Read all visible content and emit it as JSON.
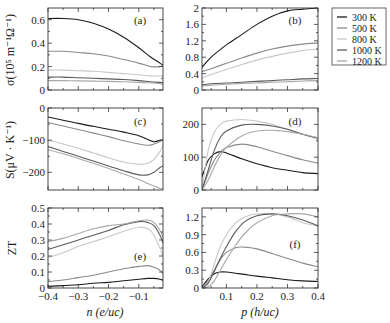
{
  "figure": {
    "legend": {
      "entries": [
        {
          "label": "300 K",
          "color": "#1a1a1a"
        },
        {
          "label": "500 K",
          "color": "#8a8a8a"
        },
        {
          "label": "800 K",
          "color": "#c8c8c8"
        },
        {
          "label": "1000 K",
          "color": "#5a5a5a"
        },
        {
          "label": "1200 K",
          "color": "#a8a8a8"
        }
      ]
    },
    "ylabels": {
      "row1": "σ(10⁵ m⁻¹Ω⁻¹)",
      "row2": "S(μV · K⁻¹)",
      "row3": "ZT"
    },
    "xlabels": {
      "left": "n (e/uc)",
      "right": "p (h/uc)"
    }
  },
  "chart_data": [
    {
      "panel": "(a)",
      "type": "line",
      "xlabel": "n (e/uc)",
      "ylabel": "σ(10^5 m^-1 Ω^-1)",
      "xlim": [
        -0.4,
        -0.02
      ],
      "ylim": [
        0,
        0.7
      ],
      "yticks": [
        0,
        0.2,
        0.4,
        0.6
      ],
      "ytick_labels": [
        "0",
        "0.2",
        "0.4",
        "0.6"
      ],
      "xticks": [
        -0.4,
        -0.3,
        -0.2,
        -0.1
      ],
      "x": [
        -0.4,
        -0.35,
        -0.3,
        -0.25,
        -0.2,
        -0.15,
        -0.1,
        -0.06,
        -0.03,
        -0.02
      ],
      "series": [
        {
          "name": "300 K",
          "values": [
            0.61,
            0.61,
            0.6,
            0.57,
            0.52,
            0.45,
            0.36,
            0.28,
            0.23,
            0.21
          ]
        },
        {
          "name": "500 K",
          "values": [
            0.33,
            0.33,
            0.32,
            0.31,
            0.29,
            0.26,
            0.23,
            0.2,
            0.2,
            0.21
          ]
        },
        {
          "name": "800 K",
          "values": [
            0.17,
            0.17,
            0.165,
            0.16,
            0.15,
            0.14,
            0.13,
            0.12,
            0.12,
            0.12
          ]
        },
        {
          "name": "1000 K",
          "values": [
            0.11,
            0.11,
            0.105,
            0.1,
            0.095,
            0.09,
            0.08,
            0.07,
            0.065,
            0.06
          ]
        },
        {
          "name": "1200 K",
          "values": [
            0.08,
            0.08,
            0.078,
            0.076,
            0.073,
            0.07,
            0.065,
            0.06,
            0.055,
            0.05
          ]
        }
      ]
    },
    {
      "panel": "(b)",
      "type": "line",
      "xlabel": "p (h/uc)",
      "ylabel": "σ(10^5 m^-1 Ω^-1)",
      "xlim": [
        0.02,
        0.4
      ],
      "ylim": [
        0,
        2.0
      ],
      "yticks": [
        0,
        0.4,
        0.8,
        1.2,
        1.6,
        2.0
      ],
      "ytick_labels": [
        "0",
        "0.4",
        "0.8",
        "1.2",
        "1.6",
        "2"
      ],
      "xticks": [
        0.1,
        0.2,
        0.3,
        0.4
      ],
      "x": [
        0.02,
        0.05,
        0.1,
        0.15,
        0.2,
        0.25,
        0.3,
        0.35,
        0.4
      ],
      "series": [
        {
          "name": "300 K",
          "values": [
            0.55,
            0.8,
            1.1,
            1.35,
            1.6,
            1.8,
            1.93,
            1.97,
            2.0
          ]
        },
        {
          "name": "500 K",
          "values": [
            0.45,
            0.52,
            0.65,
            0.78,
            0.9,
            1.0,
            1.07,
            1.12,
            1.15
          ]
        },
        {
          "name": "800 K",
          "values": [
            0.3,
            0.38,
            0.5,
            0.62,
            0.73,
            0.82,
            0.9,
            0.96,
            1.0
          ]
        },
        {
          "name": "1000 K",
          "values": [
            0.13,
            0.15,
            0.17,
            0.19,
            0.21,
            0.23,
            0.25,
            0.27,
            0.28
          ]
        },
        {
          "name": "1200 K",
          "values": [
            0.1,
            0.12,
            0.14,
            0.16,
            0.17,
            0.19,
            0.2,
            0.22,
            0.23
          ]
        }
      ]
    },
    {
      "panel": "(c)",
      "type": "line",
      "xlabel": "n (e/uc)",
      "ylabel": "S(μV·K^-1)",
      "xlim": [
        -0.4,
        -0.02
      ],
      "ylim": [
        -255,
        0
      ],
      "yticks": [
        0,
        -100,
        -200
      ],
      "ytick_labels": [
        "0",
        "−100",
        "−200"
      ],
      "xticks": [
        -0.4,
        -0.3,
        -0.2,
        -0.1
      ],
      "x": [
        -0.4,
        -0.35,
        -0.3,
        -0.25,
        -0.2,
        -0.15,
        -0.1,
        -0.07,
        -0.05,
        -0.03,
        -0.02
      ],
      "series": [
        {
          "name": "300 K",
          "values": [
            -28,
            -38,
            -48,
            -57,
            -66,
            -75,
            -86,
            -98,
            -105,
            -100,
            -100
          ]
        },
        {
          "name": "500 K",
          "values": [
            -45,
            -56,
            -67,
            -78,
            -89,
            -102,
            -112,
            -116,
            -112,
            -104,
            -98
          ]
        },
        {
          "name": "800 K",
          "values": [
            -100,
            -112,
            -125,
            -140,
            -155,
            -168,
            -175,
            -172,
            -160,
            -135,
            -115
          ]
        },
        {
          "name": "1000 K",
          "values": [
            -120,
            -135,
            -150,
            -165,
            -180,
            -195,
            -208,
            -208,
            -200,
            -185,
            -180
          ]
        },
        {
          "name": "1200 K",
          "values": [
            -130,
            -142,
            -157,
            -172,
            -188,
            -205,
            -222,
            -235,
            -243,
            -250,
            -252
          ]
        }
      ]
    },
    {
      "panel": "(d)",
      "type": "line",
      "xlabel": "p (h/uc)",
      "ylabel": "S(μV·K^-1)",
      "xlim": [
        0.02,
        0.4
      ],
      "ylim": [
        0,
        250
      ],
      "yticks": [
        0,
        100,
        200
      ],
      "ytick_labels": [
        "0",
        "100",
        "200"
      ],
      "xticks": [
        0.1,
        0.2,
        0.3,
        0.4
      ],
      "x": [
        0.02,
        0.04,
        0.06,
        0.08,
        0.1,
        0.15,
        0.2,
        0.25,
        0.3,
        0.35,
        0.4
      ],
      "series": [
        {
          "name": "300 K",
          "values": [
            40,
            90,
            110,
            117,
            113,
            95,
            80,
            68,
            60,
            53,
            50
          ]
        },
        {
          "name": "500 K",
          "values": [
            0,
            50,
            90,
            115,
            130,
            140,
            132,
            118,
            105,
            92,
            82
          ]
        },
        {
          "name": "800 K",
          "values": [
            0,
            120,
            175,
            200,
            210,
            215,
            210,
            200,
            185,
            170,
            155
          ]
        },
        {
          "name": "1000 K",
          "values": [
            0,
            60,
            120,
            160,
            180,
            198,
            200,
            195,
            185,
            170,
            158
          ]
        },
        {
          "name": "1200 K",
          "values": [
            0,
            30,
            70,
            105,
            130,
            165,
            180,
            182,
            178,
            170,
            160
          ]
        }
      ]
    },
    {
      "panel": "(e)",
      "type": "line",
      "xlabel": "n (e/uc)",
      "ylabel": "ZT",
      "xlim": [
        -0.4,
        -0.02
      ],
      "ylim": [
        0,
        0.5
      ],
      "yticks": [
        0,
        0.1,
        0.2,
        0.3,
        0.4,
        0.5
      ],
      "ytick_labels": [
        "0",
        "0.1",
        "0.2",
        "0.3",
        "0.4",
        "0.5"
      ],
      "xticks": [
        -0.4,
        -0.3,
        -0.2,
        -0.1
      ],
      "xtick_labels": [
        "−0.4",
        "−0.3",
        "−0.2",
        "−0.1"
      ],
      "x": [
        -0.4,
        -0.35,
        -0.3,
        -0.25,
        -0.2,
        -0.15,
        -0.1,
        -0.07,
        -0.05,
        -0.03,
        -0.02
      ],
      "series": [
        {
          "name": "300 K",
          "values": [
            0.01,
            0.015,
            0.02,
            0.03,
            0.035,
            0.045,
            0.055,
            0.06,
            0.06,
            0.055,
            0.05
          ]
        },
        {
          "name": "500 K",
          "values": [
            0.04,
            0.05,
            0.065,
            0.08,
            0.1,
            0.12,
            0.135,
            0.14,
            0.13,
            0.11,
            0.09
          ]
        },
        {
          "name": "800 K",
          "values": [
            0.19,
            0.22,
            0.26,
            0.29,
            0.32,
            0.355,
            0.38,
            0.37,
            0.33,
            0.25,
            0.2
          ]
        },
        {
          "name": "1000 K",
          "values": [
            0.24,
            0.27,
            0.3,
            0.33,
            0.36,
            0.395,
            0.415,
            0.41,
            0.39,
            0.33,
            0.28
          ]
        },
        {
          "name": "1200 K",
          "values": [
            0.29,
            0.31,
            0.34,
            0.37,
            0.39,
            0.4,
            0.42,
            0.425,
            0.41,
            0.36,
            0.32
          ]
        }
      ]
    },
    {
      "panel": "(f)",
      "type": "line",
      "xlabel": "p (h/uc)",
      "ylabel": "ZT",
      "xlim": [
        0.02,
        0.4
      ],
      "ylim": [
        0,
        1.35
      ],
      "yticks": [
        0,
        0.3,
        0.6,
        0.9,
        1.2
      ],
      "ytick_labels": [
        "0",
        "0.3",
        "0.6",
        "0.9",
        "1.2"
      ],
      "xticks": [
        0.1,
        0.2,
        0.3,
        0.4
      ],
      "xtick_labels": [
        "0.1",
        "0.2",
        "0.3",
        "0.4"
      ],
      "x": [
        0.02,
        0.04,
        0.06,
        0.08,
        0.1,
        0.13,
        0.16,
        0.2,
        0.25,
        0.3,
        0.35,
        0.4
      ],
      "series": [
        {
          "name": "300 K",
          "values": [
            0.02,
            0.15,
            0.24,
            0.27,
            0.27,
            0.25,
            0.23,
            0.2,
            0.17,
            0.14,
            0.12,
            0.11
          ]
        },
        {
          "name": "500 K",
          "values": [
            0.0,
            0.12,
            0.3,
            0.48,
            0.6,
            0.68,
            0.69,
            0.66,
            0.58,
            0.5,
            0.42,
            0.36
          ]
        },
        {
          "name": "800 K",
          "values": [
            0.0,
            0.1,
            0.4,
            0.7,
            0.9,
            1.1,
            1.2,
            1.25,
            1.25,
            1.2,
            1.1,
            1.05
          ]
        },
        {
          "name": "1000 K",
          "values": [
            0.0,
            0.08,
            0.28,
            0.5,
            0.7,
            0.95,
            1.12,
            1.22,
            1.25,
            1.22,
            1.15,
            1.05
          ]
        },
        {
          "name": "1200 K",
          "values": [
            0.0,
            0.02,
            0.12,
            0.3,
            0.48,
            0.72,
            0.92,
            1.1,
            1.22,
            1.25,
            1.25,
            1.2
          ]
        }
      ]
    }
  ]
}
